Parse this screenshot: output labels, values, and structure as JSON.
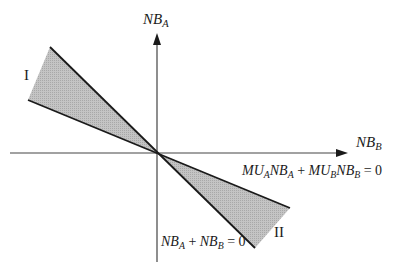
{
  "diagram": {
    "axes": {
      "vertical": {
        "var": "NB",
        "sub": "A"
      },
      "horizontal": {
        "var": "NB",
        "sub": "B"
      }
    },
    "regions": [
      {
        "label": "I"
      },
      {
        "label": "II"
      }
    ],
    "lines": {
      "mu_line": {
        "parts": [
          "MU",
          "A",
          "NB",
          "A",
          " + ",
          "MU",
          "B",
          "NB",
          "B",
          " = 0"
        ]
      },
      "sum_line": {
        "parts": [
          "NB",
          "A",
          " + ",
          "NB",
          "B",
          " = 0"
        ]
      }
    },
    "colors": {
      "line": "#1a1a1a",
      "shade": "#b5b5b5",
      "axis": "#444444"
    }
  }
}
